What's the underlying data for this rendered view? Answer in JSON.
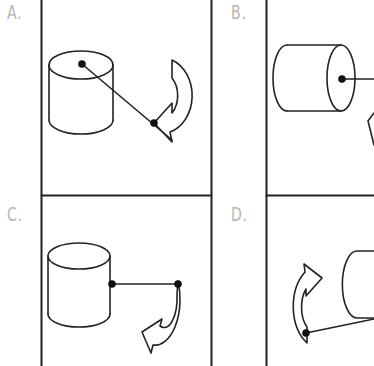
{
  "diagram": {
    "type": "multiple-choice figure",
    "panels": [
      {
        "id": "A",
        "label": "A.",
        "cylinder_orientation": "upright",
        "rod_attachment": "center of top face",
        "rod_direction": "diagonal down-right",
        "arrow_position": "right",
        "arrow_rotation": "counter-clockwise curve opening left, head pointing lower-left"
      },
      {
        "id": "B",
        "label": "B.",
        "cylinder_orientation": "horizontal",
        "rod_attachment": "center of right end face",
        "rod_direction": "horizontal right",
        "arrow_position": "lower right (clipped)",
        "arrow_rotation": "partially visible"
      },
      {
        "id": "C",
        "label": "C.",
        "cylinder_orientation": "upright",
        "rod_attachment": "right side wall, mid-height",
        "rod_direction": "horizontal right",
        "arrow_position": "lower right",
        "arrow_rotation": "curve from rod end, head pointing left"
      },
      {
        "id": "D",
        "label": "D.",
        "cylinder_orientation": "horizontal (clipped)",
        "rod_attachment": "lower left of cylinder",
        "rod_direction": "diagonal down-left",
        "arrow_position": "left",
        "arrow_rotation": "curve from rod end, head pointing upper-right"
      }
    ],
    "colors": {
      "stroke": "#222222",
      "dot": "#111111",
      "label": "#b5b5b5",
      "background": "#ffffff"
    }
  }
}
